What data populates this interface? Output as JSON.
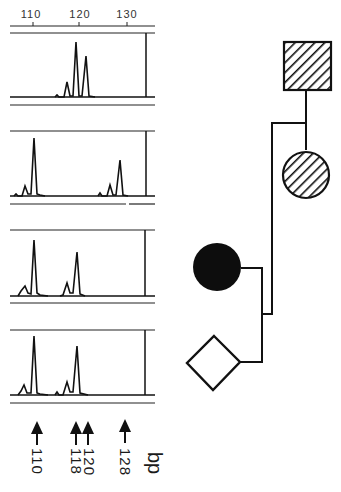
{
  "figure": {
    "type": "fragment-analysis-with-pedigree",
    "scale": {
      "ticks": [
        {
          "value": "110",
          "x": 33
        },
        {
          "value": "120",
          "x": 79
        },
        {
          "value": "130",
          "x": 127
        }
      ]
    },
    "electropherograms": [
      {
        "panel": 1,
        "peaks_bp": [
          116,
          118,
          120
        ],
        "main_alleles_bp": [
          118,
          120
        ]
      },
      {
        "panel": 2,
        "peaks_bp": [
          108,
          110,
          126,
          128
        ],
        "main_alleles_bp": [
          110,
          128
        ]
      },
      {
        "panel": 3,
        "peaks_bp": [
          108,
          110,
          116,
          118
        ],
        "main_alleles_bp": [
          110,
          118
        ]
      },
      {
        "panel": 4,
        "peaks_bp": [
          108,
          110,
          116,
          118
        ],
        "main_alleles_bp": [
          110,
          118
        ]
      }
    ],
    "arrows": [
      {
        "label": "110",
        "x": 37
      },
      {
        "label": "118",
        "x": 76
      },
      {
        "label": "120",
        "x": 88
      },
      {
        "label": "128",
        "x": 125
      }
    ],
    "unit": "bp",
    "pedigree": {
      "members": [
        {
          "id": "grandfather",
          "shape": "square",
          "fill": "hatched"
        },
        {
          "id": "grandmother",
          "shape": "circle",
          "fill": "hatched"
        },
        {
          "id": "mother",
          "shape": "circle",
          "fill": "solid"
        },
        {
          "id": "child",
          "shape": "diamond",
          "fill": "empty"
        }
      ]
    },
    "colors": {
      "ink": "#111111",
      "background": "#ffffff"
    }
  }
}
